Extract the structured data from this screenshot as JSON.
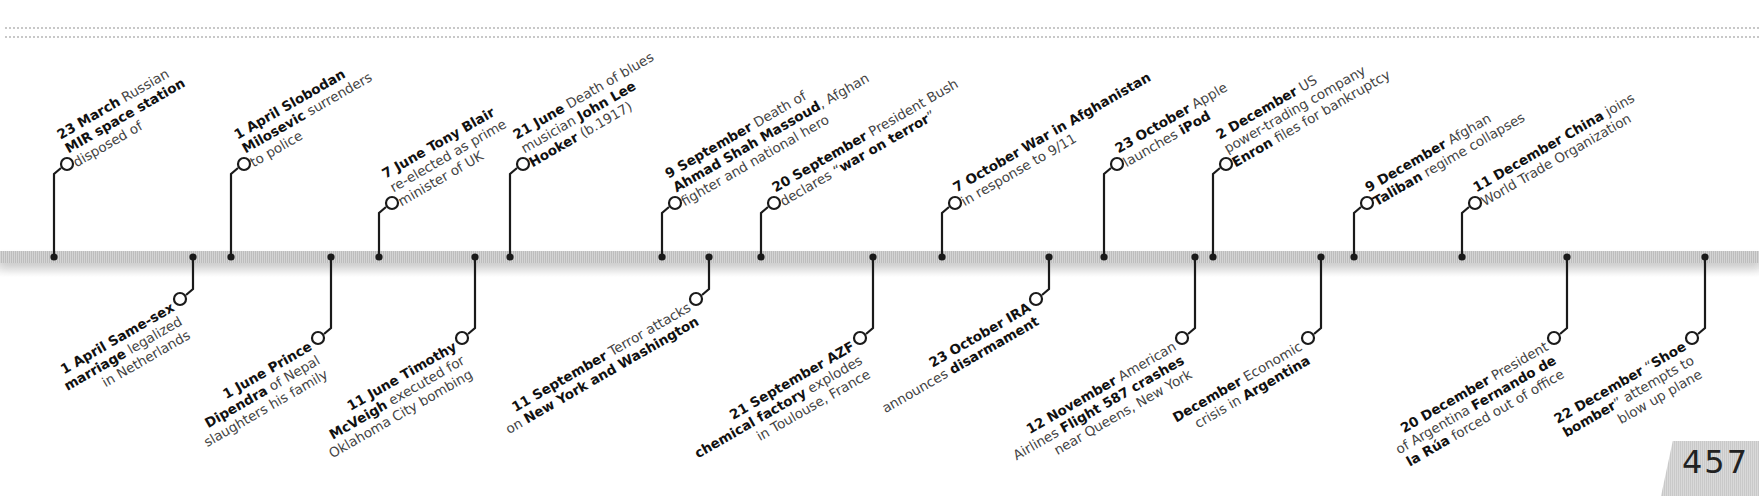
{
  "page": {
    "number": "457"
  },
  "timeline": {
    "above": [
      {
        "x": 54,
        "stem_top": 174,
        "parts": [
          [
            "b",
            "23 March"
          ],
          [
            "t",
            " Russian"
          ],
          [
            "br"
          ],
          [
            "b",
            "MIR space station"
          ],
          [
            "br"
          ],
          [
            "t",
            "disposed of"
          ]
        ]
      },
      {
        "x": 231,
        "stem_top": 174,
        "parts": [
          [
            "b",
            "1 April Slobodan"
          ],
          [
            "br"
          ],
          [
            "b",
            "Milosevic"
          ],
          [
            "t",
            " surrenders"
          ],
          [
            "br"
          ],
          [
            "t",
            "to police"
          ]
        ]
      },
      {
        "x": 379,
        "stem_top": 213,
        "parts": [
          [
            "b",
            "7 June Tony Blair"
          ],
          [
            "br"
          ],
          [
            "t",
            "re-elected as prime"
          ],
          [
            "br"
          ],
          [
            "t",
            "minister of UK"
          ]
        ]
      },
      {
        "x": 510,
        "stem_top": 174,
        "parts": [
          [
            "b",
            "21 June"
          ],
          [
            "t",
            " Death of blues"
          ],
          [
            "br"
          ],
          [
            "t",
            "musician "
          ],
          [
            "b",
            "John Lee"
          ],
          [
            "br"
          ],
          [
            "b",
            "Hooker"
          ],
          [
            "t",
            " (b.1917)"
          ]
        ]
      },
      {
        "x": 662,
        "stem_top": 213,
        "parts": [
          [
            "b",
            "9 September"
          ],
          [
            "t",
            " Death of"
          ],
          [
            "br"
          ],
          [
            "b",
            "Ahmad Shah Massoud"
          ],
          [
            "t",
            ", Afghan"
          ],
          [
            "br"
          ],
          [
            "t",
            "fighter and national hero"
          ]
        ]
      },
      {
        "x": 761,
        "stem_top": 213,
        "parts": [
          [
            "b",
            "20 September"
          ],
          [
            "t",
            " President Bush"
          ],
          [
            "br"
          ],
          [
            "t",
            "declares “"
          ],
          [
            "b",
            "war on terror"
          ],
          [
            "t",
            "”"
          ]
        ]
      },
      {
        "x": 942,
        "stem_top": 213,
        "parts": [
          [
            "b",
            "7 October War in Afghanistan"
          ],
          [
            "br"
          ],
          [
            "t",
            "in response to 9/11"
          ]
        ]
      },
      {
        "x": 1104,
        "stem_top": 174,
        "parts": [
          [
            "b",
            "23 October"
          ],
          [
            "t",
            " Apple"
          ],
          [
            "br"
          ],
          [
            "t",
            "launches "
          ],
          [
            "b",
            "iPod"
          ]
        ]
      },
      {
        "x": 1213,
        "stem_top": 174,
        "parts": [
          [
            "b",
            "2 December"
          ],
          [
            "t",
            " US"
          ],
          [
            "br"
          ],
          [
            "t",
            "power-trading company"
          ],
          [
            "br"
          ],
          [
            "b",
            "Enron"
          ],
          [
            "t",
            " files for bankruptcy"
          ]
        ]
      },
      {
        "x": 1354,
        "stem_top": 213,
        "parts": [
          [
            "b",
            "9 December"
          ],
          [
            "t",
            " Afghan"
          ],
          [
            "br"
          ],
          [
            "b",
            "Taliban"
          ],
          [
            "t",
            " regime collapses"
          ]
        ]
      },
      {
        "x": 1462,
        "stem_top": 213,
        "parts": [
          [
            "b",
            "11 December China"
          ],
          [
            "t",
            " joins"
          ],
          [
            "br"
          ],
          [
            "t",
            "World Trade Organization"
          ]
        ]
      }
    ],
    "below": [
      {
        "x": 193,
        "stem_bottom": 289,
        "parts": [
          [
            "b",
            "1 April Same-sex"
          ],
          [
            "br"
          ],
          [
            "b",
            "marriage"
          ],
          [
            "t",
            " legalized"
          ],
          [
            "br"
          ],
          [
            "t",
            "in Netherlands"
          ]
        ]
      },
      {
        "x": 331,
        "stem_bottom": 328,
        "parts": [
          [
            "b",
            "1 June Prince"
          ],
          [
            "br"
          ],
          [
            "b",
            "Dipendra"
          ],
          [
            "t",
            " of Nepal"
          ],
          [
            "br"
          ],
          [
            "t",
            "slaughters his family"
          ]
        ]
      },
      {
        "x": 475,
        "stem_bottom": 328,
        "parts": [
          [
            "b",
            "11 June Timothy"
          ],
          [
            "br"
          ],
          [
            "b",
            "McVeigh"
          ],
          [
            "t",
            " executed for"
          ],
          [
            "br"
          ],
          [
            "t",
            "Oklahoma City bombing"
          ]
        ]
      },
      {
        "x": 709,
        "stem_bottom": 289,
        "parts": [
          [
            "b",
            "11 September"
          ],
          [
            "t",
            " Terror attacks"
          ],
          [
            "br"
          ],
          [
            "t",
            "on "
          ],
          [
            "b",
            "New York and Washington"
          ]
        ]
      },
      {
        "x": 873,
        "stem_bottom": 328,
        "parts": [
          [
            "b",
            "21 September AZF"
          ],
          [
            "br"
          ],
          [
            "b",
            "chemical factory"
          ],
          [
            "t",
            " explodes"
          ],
          [
            "br"
          ],
          [
            "t",
            "in Toulouse, France"
          ]
        ]
      },
      {
        "x": 1049,
        "stem_bottom": 289,
        "parts": [
          [
            "b",
            "23 October IRA"
          ],
          [
            "br"
          ],
          [
            "t",
            "announces "
          ],
          [
            "b",
            "disarmament"
          ]
        ]
      },
      {
        "x": 1195,
        "stem_bottom": 328,
        "parts": [
          [
            "b",
            "12 November"
          ],
          [
            "t",
            " American"
          ],
          [
            "br"
          ],
          [
            "t",
            "Airlines "
          ],
          [
            "b",
            "Flight 587 crashes"
          ],
          [
            "br"
          ],
          [
            "t",
            "near Queens, New York"
          ]
        ]
      },
      {
        "x": 1321,
        "stem_bottom": 328,
        "parts": [
          [
            "b",
            "December"
          ],
          [
            "t",
            " Economic"
          ],
          [
            "br"
          ],
          [
            "t",
            "crisis in "
          ],
          [
            "b",
            "Argentina"
          ]
        ]
      },
      {
        "x": 1567,
        "stem_bottom": 328,
        "parts": [
          [
            "b",
            "20 December"
          ],
          [
            "t",
            " President"
          ],
          [
            "br"
          ],
          [
            "t",
            "of Argentina "
          ],
          [
            "b",
            "Fernando de"
          ],
          [
            "br"
          ],
          [
            "b",
            "la Rúa"
          ],
          [
            "t",
            " forced out of office"
          ]
        ]
      },
      {
        "x": 1705,
        "stem_bottom": 328,
        "parts": [
          [
            "b",
            "22 December"
          ],
          [
            "t",
            " “"
          ],
          [
            "b",
            "Shoe"
          ],
          [
            "br"
          ],
          [
            "b",
            "bomber"
          ],
          [
            "t",
            "” attempts to"
          ],
          [
            "br"
          ],
          [
            "t",
            "blow up plane"
          ]
        ]
      }
    ]
  }
}
